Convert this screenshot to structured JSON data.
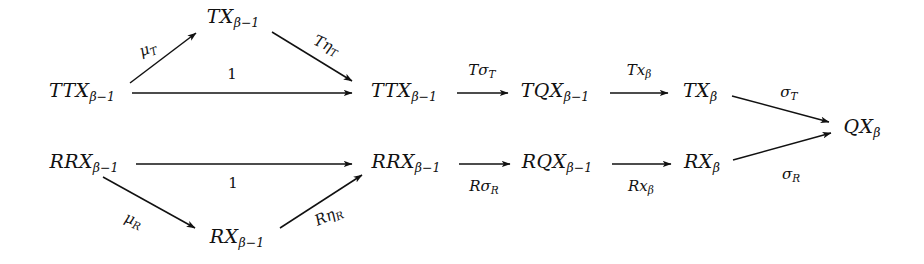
{
  "diagram": {
    "kind": "commutative-diagram",
    "background": "#ffffff",
    "ink": "#111111",
    "width": 924,
    "height": 264,
    "nodes": [
      {
        "id": "n-ttx-left",
        "label": "TTX",
        "sub": "β−1",
        "x": 82,
        "y": 92
      },
      {
        "id": "n-tx-apex",
        "label": "TX",
        "sub": "β−1",
        "x": 233,
        "y": 18
      },
      {
        "id": "n-ttx-mid",
        "label": "TTX",
        "sub": "β−1",
        "x": 404,
        "y": 92
      },
      {
        "id": "n-tqx",
        "label": "TQX",
        "sub": "β−1",
        "x": 555,
        "y": 92
      },
      {
        "id": "n-tx-beta",
        "label": "TX",
        "sub": "β",
        "x": 700,
        "y": 92
      },
      {
        "id": "n-qx-beta",
        "label": "QX",
        "sub": "β",
        "x": 862,
        "y": 128
      },
      {
        "id": "n-rrx-left",
        "label": "RRX",
        "sub": "β−1",
        "x": 84,
        "y": 163
      },
      {
        "id": "n-rrx-mid",
        "label": "RRX",
        "sub": "β−1",
        "x": 406,
        "y": 163
      },
      {
        "id": "n-rqx",
        "label": "RQX",
        "sub": "β−1",
        "x": 557,
        "y": 163
      },
      {
        "id": "n-rx-beta",
        "label": "RX",
        "sub": "β",
        "x": 702,
        "y": 163
      },
      {
        "id": "n-rx-apex",
        "label": "RX",
        "sub": "β−1",
        "x": 237,
        "y": 238
      }
    ],
    "arrows": [
      {
        "id": "a-mu-t",
        "from": "n-ttx-left",
        "to": "n-tx-apex",
        "x1": 130,
        "y1": 83,
        "x2": 196,
        "y2": 33
      },
      {
        "id": "a-t-eta-t",
        "from": "n-tx-apex",
        "to": "n-ttx-mid",
        "x1": 272,
        "y1": 32,
        "x2": 352,
        "y2": 81
      },
      {
        "id": "a-one-top",
        "from": "n-ttx-left",
        "to": "n-ttx-mid",
        "x1": 132,
        "y1": 93,
        "x2": 352,
        "y2": 93
      },
      {
        "id": "a-t-sigma-t",
        "from": "n-ttx-mid",
        "to": "n-tqx",
        "x1": 457,
        "y1": 93,
        "x2": 508,
        "y2": 93
      },
      {
        "id": "a-t-x-beta",
        "from": "n-tqx",
        "to": "n-tx-beta",
        "x1": 610,
        "y1": 93,
        "x2": 668,
        "y2": 93
      },
      {
        "id": "a-sigma-t",
        "from": "n-tx-beta",
        "to": "n-qx-beta",
        "x1": 732,
        "y1": 96,
        "x2": 829,
        "y2": 122
      },
      {
        "id": "a-one-bot",
        "from": "n-rrx-left",
        "to": "n-rrx-mid",
        "x1": 136,
        "y1": 164,
        "x2": 352,
        "y2": 164
      },
      {
        "id": "a-r-sigma-r",
        "from": "n-rrx-mid",
        "to": "n-rqx",
        "x1": 459,
        "y1": 164,
        "x2": 510,
        "y2": 164
      },
      {
        "id": "a-r-x-beta",
        "from": "n-rqx",
        "to": "n-rx-beta",
        "x1": 612,
        "y1": 164,
        "x2": 671,
        "y2": 164
      },
      {
        "id": "a-sigma-r",
        "from": "n-rx-beta",
        "to": "n-qx-beta",
        "x1": 733,
        "y1": 160,
        "x2": 831,
        "y2": 133
      },
      {
        "id": "a-mu-r",
        "from": "n-rrx-left",
        "to": "n-rx-apex",
        "x1": 103,
        "y1": 177,
        "x2": 195,
        "y2": 228
      },
      {
        "id": "a-r-eta-r",
        "from": "n-rx-apex",
        "to": "n-rrx-mid",
        "x1": 280,
        "y1": 228,
        "x2": 362,
        "y2": 175
      }
    ],
    "labels": [
      {
        "id": "l-mu-t",
        "for": "a-mu-t",
        "text": "μ",
        "sub": "T",
        "x": 148,
        "y": 50,
        "style": "rot-up",
        "italic": true
      },
      {
        "id": "l-t-eta-t",
        "for": "a-t-eta-t",
        "text": "Tη",
        "sub": "T",
        "x": 326,
        "y": 46,
        "style": "rot-down",
        "italic": true
      },
      {
        "id": "l-one-top",
        "for": "a-one-top",
        "text": "1",
        "sub": "",
        "x": 232,
        "y": 74,
        "style": "flat",
        "italic": false
      },
      {
        "id": "l-t-sigma-t",
        "for": "a-t-sigma-t",
        "text": "Tσ",
        "sub": "T",
        "x": 482,
        "y": 71,
        "style": "flat",
        "italic": true
      },
      {
        "id": "l-t-x-beta",
        "for": "a-t-x-beta",
        "text": "Tx",
        "sub": "β",
        "x": 639,
        "y": 71,
        "style": "flat",
        "italic": true
      },
      {
        "id": "l-sigma-t",
        "for": "a-sigma-t",
        "text": "σ",
        "sub": "T",
        "x": 789,
        "y": 93,
        "style": "flat",
        "italic": true
      },
      {
        "id": "l-one-bot",
        "for": "a-one-bot",
        "text": "1",
        "sub": "",
        "x": 233,
        "y": 183,
        "style": "flat",
        "italic": false
      },
      {
        "id": "l-r-sigma-r",
        "for": "a-r-sigma-r",
        "text": "Rσ",
        "sub": "R",
        "x": 484,
        "y": 187,
        "style": "flat",
        "italic": true
      },
      {
        "id": "l-r-x-beta",
        "for": "a-r-x-beta",
        "text": "Rx",
        "sub": "β",
        "x": 641,
        "y": 187,
        "style": "flat",
        "italic": true
      },
      {
        "id": "l-sigma-r",
        "for": "a-sigma-r",
        "text": "σ",
        "sub": "R",
        "x": 791,
        "y": 175,
        "style": "flat",
        "italic": true
      },
      {
        "id": "l-mu-r",
        "for": "a-mu-r",
        "text": "μ",
        "sub": "R",
        "x": 133,
        "y": 221,
        "style": "rot-dn-small",
        "italic": true
      },
      {
        "id": "l-r-eta-r",
        "for": "a-r-eta-r",
        "text": "Rη",
        "sub": "R",
        "x": 329,
        "y": 217,
        "style": "rot-up-small",
        "italic": true
      }
    ]
  }
}
